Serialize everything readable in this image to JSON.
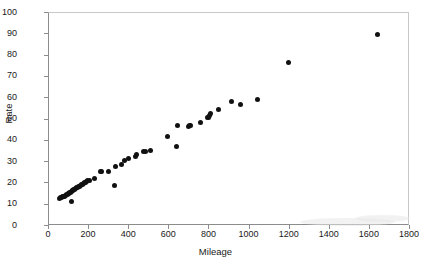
{
  "chart_data": {
    "type": "scatter",
    "title": "",
    "xlabel": "Mileage",
    "ylabel": "Rate",
    "xlim": [
      0,
      1800
    ],
    "ylim": [
      0,
      100
    ],
    "xticks": [
      0,
      200,
      400,
      600,
      800,
      1000,
      1200,
      1400,
      1600,
      1800
    ],
    "yticks": [
      0,
      10,
      20,
      30,
      40,
      50,
      60,
      70,
      80,
      90,
      100
    ],
    "grid": false,
    "legend": null,
    "marker": {
      "shape": "circle",
      "color": "#111111",
      "size": 5
    },
    "series": [
      {
        "name": "Rate vs Mileage",
        "points": [
          [
            55,
            12.6
          ],
          [
            62,
            12.8
          ],
          [
            68,
            13.0
          ],
          [
            72,
            13.2
          ],
          [
            78,
            13.4
          ],
          [
            83,
            13.6
          ],
          [
            88,
            13.9
          ],
          [
            92,
            14.1
          ],
          [
            96,
            14.4
          ],
          [
            100,
            14.6
          ],
          [
            104,
            14.9
          ],
          [
            108,
            15.2
          ],
          [
            112,
            15.4
          ],
          [
            116,
            15.7
          ],
          [
            120,
            16.0
          ],
          [
            118,
            11.2
          ],
          [
            124,
            16.3
          ],
          [
            128,
            16.6
          ],
          [
            132,
            16.9
          ],
          [
            136,
            17.2
          ],
          [
            140,
            17.4
          ],
          [
            145,
            17.7
          ],
          [
            150,
            18.0
          ],
          [
            155,
            18.3
          ],
          [
            160,
            18.6
          ],
          [
            165,
            18.9
          ],
          [
            170,
            19.2
          ],
          [
            175,
            19.5
          ],
          [
            180,
            19.8
          ],
          [
            186,
            20.1
          ],
          [
            192,
            20.4
          ],
          [
            198,
            20.7
          ],
          [
            205,
            21.0
          ],
          [
            232,
            21.9
          ],
          [
            262,
            25.0
          ],
          [
            268,
            24.9
          ],
          [
            300,
            24.9
          ],
          [
            330,
            18.4
          ],
          [
            335,
            27.6
          ],
          [
            368,
            28.5
          ],
          [
            383,
            30.3
          ],
          [
            402,
            31.0
          ],
          [
            434,
            32.2
          ],
          [
            442,
            33.0
          ],
          [
            476,
            34.7
          ],
          [
            488,
            34.7
          ],
          [
            512,
            35.2
          ],
          [
            597,
            41.6
          ],
          [
            640,
            36.7
          ],
          [
            648,
            46.7
          ],
          [
            700,
            46.3
          ],
          [
            706,
            46.6
          ],
          [
            712,
            46.8
          ],
          [
            758,
            48.3
          ],
          [
            796,
            50.4
          ],
          [
            802,
            50.6
          ],
          [
            806,
            51.4
          ],
          [
            808,
            52.2
          ],
          [
            848,
            54.0
          ],
          [
            916,
            58.2
          ],
          [
            958,
            56.6
          ],
          [
            1046,
            59.0
          ],
          [
            1200,
            76.2
          ],
          [
            1645,
            89.6
          ]
        ]
      }
    ]
  }
}
